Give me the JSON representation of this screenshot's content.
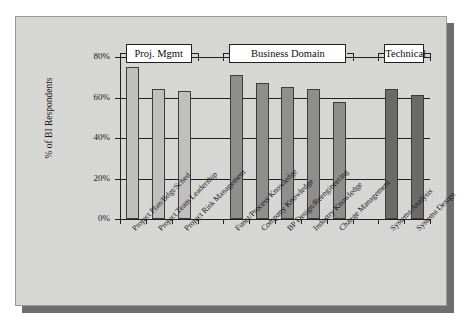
{
  "chart_data": {
    "type": "bar",
    "title": "",
    "subtitle": "",
    "xlabel": "",
    "ylabel": "% of BI Respondents",
    "ylim": [
      0,
      80
    ],
    "ytick_labels": [
      "0%",
      "20%",
      "40%",
      "60%",
      "80%"
    ],
    "ytick_values": [
      0,
      20,
      40,
      60,
      80
    ],
    "grid": true,
    "legend": "none",
    "categories": [
      "Project Plan/Bdgt/Sched",
      "Project Team Leadership",
      "Project Risk Management",
      "Funct/Process Knowledge",
      "Company Knowledge",
      "BP Design/Reengineering",
      "Industry Knowledge",
      "Change Management",
      "Systems Analysis",
      "Systems Design"
    ],
    "values": [
      75,
      64,
      63,
      71,
      67,
      65,
      64,
      58,
      64,
      61
    ],
    "group_of_bar": [
      0,
      0,
      0,
      1,
      1,
      1,
      1,
      1,
      2,
      2
    ],
    "groups": [
      {
        "label": "Proj. Mgmt",
        "color": "#bfbfbd",
        "bar_indices": [
          0,
          1,
          2
        ]
      },
      {
        "label": "Business Domain",
        "color": "#8e8e8c",
        "bar_indices": [
          3,
          4,
          5,
          6,
          7
        ]
      },
      {
        "label": "Technical",
        "color": "#6b6b69",
        "bar_indices": [
          8,
          9
        ]
      }
    ]
  },
  "figure": {
    "panel_background": "#d6d6d4",
    "shadow_color": "#6e6e6e",
    "axis_color": "#231f1f"
  }
}
